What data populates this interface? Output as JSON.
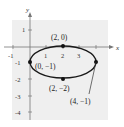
{
  "diagram": {
    "type": "ellipse-graph",
    "axes": {
      "x_label": "x",
      "y_label": "y"
    },
    "x_ticks": [
      "-1",
      "1",
      "2",
      "3"
    ],
    "y_ticks": [
      "1",
      "-1",
      "-2",
      "-3",
      "-4"
    ],
    "points": [
      {
        "label": "(2, 0)",
        "x": 2,
        "y": 0
      },
      {
        "label": "(0, −1)",
        "x": 0,
        "y": -1
      },
      {
        "label": "(2, −2)",
        "x": 2,
        "y": -2
      },
      {
        "label": "(4, −1)",
        "x": 4,
        "y": -1
      }
    ],
    "ellipse": {
      "center": [
        2,
        -1
      ],
      "rx": 2,
      "ry": 1
    },
    "colors": {
      "background": "#f0f0f0",
      "curve": "#1a1a1a",
      "axis": "#666666"
    }
  }
}
